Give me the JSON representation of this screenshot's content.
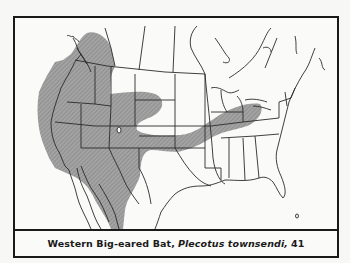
{
  "figure": {
    "type": "species-range-map",
    "region": "North America",
    "caption": {
      "common_name": "Western Big-eared Bat,",
      "scientific_name": "Plecotus townsendi,",
      "number": "41"
    },
    "legend": {
      "range_fill": "#9a9a9a",
      "range_label": "Shaded area: range"
    },
    "colors": {
      "background": "#fafaf8",
      "border": "#1a1a1a",
      "range": "#9a9a9a",
      "lines": "#2a2a2a"
    }
  }
}
